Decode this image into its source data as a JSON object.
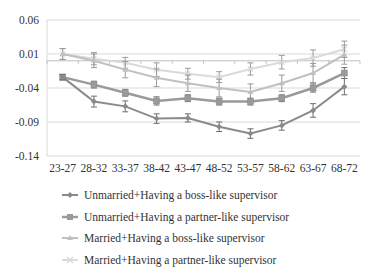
{
  "chart_data": {
    "type": "line",
    "title": "",
    "xlabel": "",
    "ylabel": "",
    "categories": [
      "23-27",
      "28-32",
      "33-37",
      "38-42",
      "43-47",
      "48-52",
      "53-57",
      "58-62",
      "63-67",
      "68-72"
    ],
    "yticks": [
      "0.06",
      "0.01",
      "-0.04",
      "-0.09",
      "-0.14"
    ],
    "ylim": [
      -0.14,
      0.06
    ],
    "grid": true,
    "error_bars": true,
    "legend_position": "bottom",
    "series": [
      {
        "name": "Unmarried+Having  a boss-like supervisor",
        "marker": "diamond",
        "color": "#8a8a8a",
        "values": [
          -0.024,
          -0.06,
          -0.067,
          -0.085,
          -0.084,
          -0.097,
          -0.107,
          -0.095,
          -0.073,
          -0.038
        ],
        "err": [
          0.004,
          0.008,
          0.008,
          0.007,
          0.006,
          0.007,
          0.007,
          0.007,
          0.01,
          0.012
        ]
      },
      {
        "name": "Unmarried+Having  a partner-like supervisor",
        "marker": "square",
        "color": "#9a9a9a",
        "values": [
          -0.024,
          -0.035,
          -0.047,
          -0.059,
          -0.055,
          -0.06,
          -0.06,
          -0.055,
          -0.04,
          -0.018
        ],
        "err": [
          0.004,
          0.005,
          0.005,
          0.006,
          0.005,
          0.005,
          0.005,
          0.005,
          0.006,
          0.008
        ]
      },
      {
        "name": "Married+Having  a boss-like supervisor",
        "marker": "triangle",
        "color": "#c0c0c0",
        "values": [
          0.01,
          0.0,
          -0.013,
          -0.025,
          -0.033,
          -0.04,
          -0.046,
          -0.033,
          -0.018,
          0.009
        ],
        "err": [
          0.008,
          0.01,
          0.012,
          0.013,
          0.012,
          0.013,
          0.012,
          0.012,
          0.014,
          0.014
        ]
      },
      {
        "name": "Married+Having  a partner-like supervisor",
        "marker": "cross",
        "color": "#dadada",
        "values": [
          0.01,
          0.003,
          -0.003,
          -0.013,
          -0.019,
          -0.024,
          -0.012,
          -0.002,
          0.004,
          0.017
        ],
        "err": [
          0.008,
          0.009,
          0.008,
          0.01,
          0.008,
          0.008,
          0.009,
          0.01,
          0.012,
          0.012
        ]
      }
    ]
  },
  "legend": {
    "items": [
      {
        "label": "Unmarried+Having  a boss-like supervisor"
      },
      {
        "label": "Unmarried+Having  a partner-like supervisor"
      },
      {
        "label": "Married+Having  a boss-like supervisor"
      },
      {
        "label": "Married+Having  a partner-like supervisor"
      }
    ]
  }
}
